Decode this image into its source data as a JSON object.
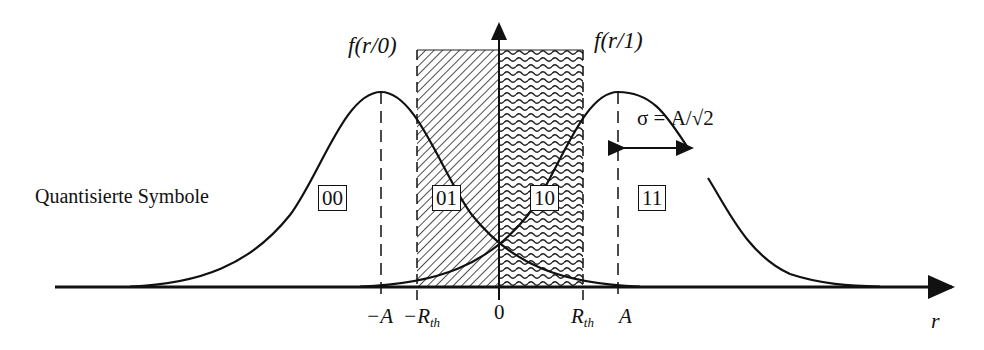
{
  "diagram": {
    "title_left_curve": "f(r/0)",
    "title_right_curve": "f(r/1)",
    "sigma_label": "σ = A/√2",
    "side_label": "Quantisierte Symbole",
    "x_axis_label": "r",
    "regions": [
      {
        "code": "00",
        "pattern": "none"
      },
      {
        "code": "01",
        "pattern": "diagonal-hatch"
      },
      {
        "code": "10",
        "pattern": "wavy-hatch"
      },
      {
        "code": "11",
        "pattern": "none"
      }
    ],
    "ticks": [
      {
        "label": "−A",
        "sub": ""
      },
      {
        "label": "−R",
        "sub": "th"
      },
      {
        "label": "0",
        "sub": ""
      },
      {
        "label": "R",
        "sub": "th"
      },
      {
        "label": "A",
        "sub": ""
      }
    ],
    "colors": {
      "line": "#111111",
      "background": "#ffffff"
    }
  }
}
